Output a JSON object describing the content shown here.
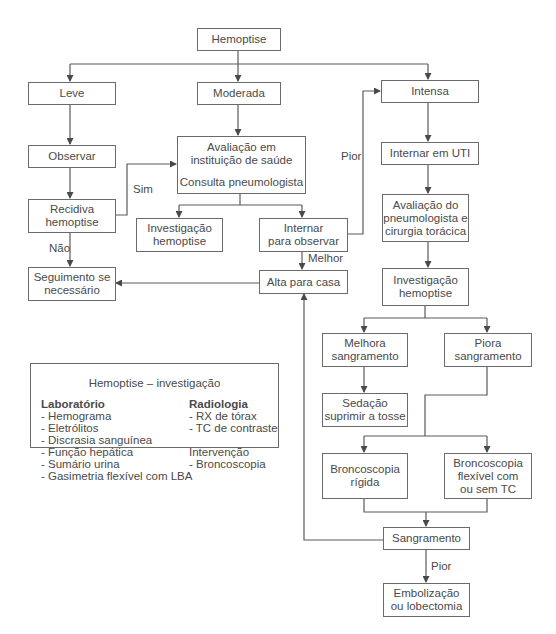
{
  "diagram": {
    "root": {
      "label": "Hemoptise"
    },
    "severity": {
      "mild": "Leve",
      "moderate": "Moderada",
      "severe": "Intensa"
    },
    "mild_branch": {
      "observe": "Observar",
      "recurrence": [
        "Recidiva",
        "hemoptise"
      ],
      "follow_up": [
        "Seguimento se",
        "necessário"
      ],
      "yes_label": "Sim",
      "no_label": "Não"
    },
    "moderate_branch": {
      "evaluation": [
        "Avaliação em",
        "instituição de saúde"
      ],
      "consult": "Consulta pneumologista",
      "investigation": [
        "Investigação",
        "hemoptise"
      ],
      "admit_observe": [
        "Internar",
        "para observar"
      ],
      "discharge": "Alta para casa",
      "better_label": "Melhor",
      "worse_label": "Pior"
    },
    "severe_branch": {
      "icu": "Internar em UTI",
      "specialist_eval": [
        "Avaliação do",
        "pneumologista e",
        "cirurgia torácica"
      ],
      "investigation": [
        "Investigação",
        "hemoptise"
      ],
      "improves": [
        "Melhora",
        "sangramento"
      ],
      "worsens": [
        "Piora",
        "sangramento"
      ],
      "sedation": [
        "Sedação",
        "suprimir a tosse"
      ],
      "rigid_bronch": [
        "Broncoscopia",
        "rígida"
      ],
      "flex_bronch": [
        "Broncoscopia",
        "flexível com",
        "ou sem TC"
      ],
      "bleeding": "Sangramento",
      "worse_label": "Pior",
      "final": [
        "Embolização",
        "ou lobectomia"
      ]
    },
    "legend": {
      "title": "Hemoptise – investigação",
      "lab": {
        "heading": "Laboratório",
        "items": [
          "- Hemograma",
          "- Eletrólitos",
          "- Discrasia sanguínea",
          "- Função hepática",
          "- Sumário urina",
          "- Gasimetria flexível com LBA"
        ]
      },
      "radiology": {
        "heading": "Radiologia",
        "items": [
          "- RX de tórax",
          "- TC de contraste"
        ]
      },
      "intervention": {
        "heading": "Intervenção",
        "items": [
          "- Broncoscopia"
        ]
      }
    },
    "colors": {
      "line": "#5a5a5a",
      "text": "#4a4a4a",
      "border": "#6b6b6b",
      "background": "#ffffff"
    }
  }
}
